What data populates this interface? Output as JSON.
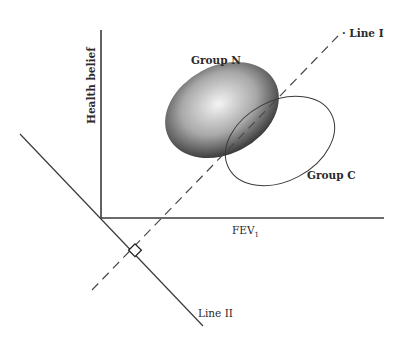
{
  "diagram": {
    "axes": {
      "x_label": "FEV",
      "x_label_subscript": "1",
      "y_label": "Health belief"
    },
    "groups": [
      {
        "name": "Group N",
        "style": "filled-shaded"
      },
      {
        "name": "Group C",
        "style": "outline"
      }
    ],
    "lines": [
      {
        "name": "Line I",
        "style": "dashed"
      },
      {
        "name": "Line II",
        "style": "solid"
      }
    ],
    "markers": {
      "right_angle": "square"
    },
    "colors": {
      "stroke": "#3a3a3a",
      "fill_dark": "#333333",
      "fill_light": "#f2f2f2"
    }
  }
}
